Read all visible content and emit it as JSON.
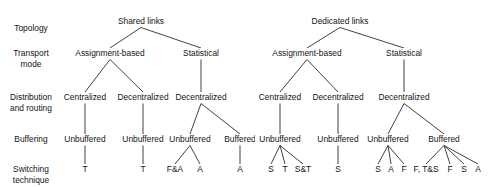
{
  "diagram": {
    "type": "tree",
    "background_color": "#ffffff",
    "line_color": "#2b2b2b",
    "text_color": "#131313"
  },
  "row_labels": [
    {
      "id": "topology",
      "lines": [
        "Topology"
      ],
      "y": 31
    },
    {
      "id": "transport-mode",
      "lines": [
        "Transport",
        "mode"
      ],
      "y": 56
    },
    {
      "id": "distribution-and-routing",
      "lines": [
        "Distribution",
        "and routing"
      ],
      "y": 100
    },
    {
      "id": "buffering",
      "lines": [
        "Buffering"
      ],
      "y": 142
    },
    {
      "id": "switching-technique",
      "lines": [
        "Switching",
        "technique"
      ],
      "y": 172
    }
  ],
  "levels": {
    "topology_y": 24,
    "transport_y": 56,
    "distribution_y": 100,
    "buffering_y": 142,
    "leaf_y": 172
  },
  "nodes": {
    "topology": [
      {
        "id": "shared-links",
        "label": "Shared links",
        "x": 141
      },
      {
        "id": "dedicated-links",
        "label": "Dedicated links",
        "x": 340
      }
    ],
    "transport": [
      {
        "id": "shared-assignment-based",
        "label": "Assignment-based",
        "x": 110
      },
      {
        "id": "shared-statistical",
        "label": "Statistical",
        "x": 201
      },
      {
        "id": "dedicated-assignment-based",
        "label": "Assignment-based",
        "x": 307
      },
      {
        "id": "dedicated-statistical",
        "label": "Statistical",
        "x": 404
      }
    ],
    "distribution": [
      {
        "id": "shared-ab-centralized",
        "label": "Centralized",
        "x": 85
      },
      {
        "id": "shared-ab-decentralized",
        "label": "Decentralized",
        "x": 143
      },
      {
        "id": "shared-st-decentralized",
        "label": "Decentralized",
        "x": 201
      },
      {
        "id": "dedicated-ab-centralized",
        "label": "Centralized",
        "x": 280
      },
      {
        "id": "dedicated-ab-decentralized",
        "label": "Decentralized",
        "x": 338
      },
      {
        "id": "dedicated-st-decentralized",
        "label": "Decentralized",
        "x": 404
      }
    ],
    "buffering": [
      {
        "id": "buf-1",
        "label": "Unbuffered",
        "x": 85
      },
      {
        "id": "buf-2",
        "label": "Unbuffered",
        "x": 143
      },
      {
        "id": "buf-3",
        "label": "Unbuffered",
        "x": 190
      },
      {
        "id": "buf-4",
        "label": "Buffered",
        "x": 240
      },
      {
        "id": "buf-5",
        "label": "Unbuffered",
        "x": 280
      },
      {
        "id": "buf-6",
        "label": "Unbuffered",
        "x": 338
      },
      {
        "id": "buf-7",
        "label": "Unbuffered",
        "x": 388
      },
      {
        "id": "buf-8",
        "label": "Buffered",
        "x": 444
      }
    ],
    "leaves": [
      {
        "id": "leaf-1",
        "label": "T",
        "x": 85,
        "parent": "buf-1"
      },
      {
        "id": "leaf-2",
        "label": "T",
        "x": 143,
        "parent": "buf-2"
      },
      {
        "id": "leaf-3",
        "label": "F&A",
        "x": 175,
        "parent": "buf-3"
      },
      {
        "id": "leaf-4",
        "label": "A",
        "x": 200,
        "parent": "buf-3"
      },
      {
        "id": "leaf-5",
        "label": "A",
        "x": 240,
        "parent": "buf-4"
      },
      {
        "id": "leaf-6",
        "label": "S",
        "x": 271,
        "parent": "buf-5"
      },
      {
        "id": "leaf-7",
        "label": "T",
        "x": 285,
        "parent": "buf-5"
      },
      {
        "id": "leaf-8",
        "label": "S&T",
        "x": 303,
        "parent": "buf-5"
      },
      {
        "id": "leaf-9",
        "label": "S",
        "x": 338,
        "parent": "buf-6"
      },
      {
        "id": "leaf-10",
        "label": "S",
        "x": 378,
        "parent": "buf-7"
      },
      {
        "id": "leaf-11",
        "label": "A",
        "x": 391,
        "parent": "buf-7"
      },
      {
        "id": "leaf-12",
        "label": "F",
        "x": 404,
        "parent": "buf-7"
      },
      {
        "id": "leaf-13",
        "label": "F, T&S",
        "x": 426,
        "parent": "buf-8"
      },
      {
        "id": "leaf-14",
        "label": "F",
        "x": 450,
        "parent": "buf-8"
      },
      {
        "id": "leaf-15",
        "label": "S",
        "x": 464,
        "parent": "buf-8"
      },
      {
        "id": "leaf-16",
        "label": "A",
        "x": 478,
        "parent": "buf-8"
      }
    ]
  },
  "edges": [
    {
      "from": "shared-links",
      "to": "shared-assignment-based"
    },
    {
      "from": "shared-links",
      "to": "shared-statistical"
    },
    {
      "from": "dedicated-links",
      "to": "dedicated-assignment-based"
    },
    {
      "from": "dedicated-links",
      "to": "dedicated-statistical"
    },
    {
      "from": "shared-assignment-based",
      "to": "shared-ab-centralized"
    },
    {
      "from": "shared-assignment-based",
      "to": "shared-ab-decentralized"
    },
    {
      "from": "shared-statistical",
      "to": "shared-st-decentralized"
    },
    {
      "from": "dedicated-assignment-based",
      "to": "dedicated-ab-centralized"
    },
    {
      "from": "dedicated-assignment-based",
      "to": "dedicated-ab-decentralized"
    },
    {
      "from": "dedicated-statistical",
      "to": "dedicated-st-decentralized"
    },
    {
      "from": "shared-ab-centralized",
      "to": "buf-1"
    },
    {
      "from": "shared-ab-decentralized",
      "to": "buf-2"
    },
    {
      "from": "shared-st-decentralized",
      "to": "buf-3"
    },
    {
      "from": "shared-st-decentralized",
      "to": "buf-4"
    },
    {
      "from": "dedicated-ab-centralized",
      "to": "buf-5"
    },
    {
      "from": "dedicated-ab-decentralized",
      "to": "buf-6"
    },
    {
      "from": "dedicated-st-decentralized",
      "to": "buf-7"
    },
    {
      "from": "dedicated-st-decentralized",
      "to": "buf-8"
    }
  ]
}
